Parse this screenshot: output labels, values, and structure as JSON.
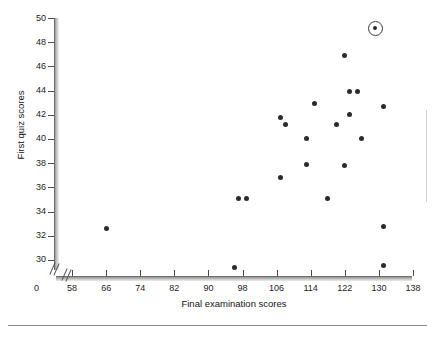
{
  "figure": {
    "title": "",
    "origin_label": "0"
  },
  "chart_data": {
    "type": "scatter",
    "title": "",
    "xlabel": "Final examination scores",
    "ylabel": "First quiz scores",
    "xlim": [
      54,
      138
    ],
    "ylim": [
      29,
      50
    ],
    "xticks": [
      58,
      66,
      74,
      82,
      90,
      98,
      106,
      114,
      122,
      130,
      138
    ],
    "yticks": [
      30,
      32,
      34,
      36,
      38,
      40,
      42,
      44,
      46,
      48,
      50
    ],
    "xtick_labels": [
      "58",
      "66",
      "74",
      "82",
      "90",
      "98",
      "106",
      "114",
      "122",
      "130",
      "138"
    ],
    "ytick_labels": [
      "30",
      "32",
      "34",
      "36",
      "38",
      "40",
      "42",
      "44",
      "46",
      "48",
      "50"
    ],
    "grid": false,
    "legend": false,
    "axis_break_x": true,
    "axis_break_y": true,
    "points": [
      {
        "x": 66,
        "y": 32.6,
        "highlighted": false
      },
      {
        "x": 96,
        "y": 29.4,
        "highlighted": false
      },
      {
        "x": 97,
        "y": 35.1,
        "highlighted": false
      },
      {
        "x": 99,
        "y": 35.1,
        "highlighted": false
      },
      {
        "x": 107,
        "y": 36.8,
        "highlighted": false
      },
      {
        "x": 107,
        "y": 41.8,
        "highlighted": false
      },
      {
        "x": 108,
        "y": 41.2,
        "highlighted": false
      },
      {
        "x": 113,
        "y": 37.9,
        "highlighted": false
      },
      {
        "x": 113,
        "y": 40.0,
        "highlighted": false
      },
      {
        "x": 115,
        "y": 42.9,
        "highlighted": false
      },
      {
        "x": 118,
        "y": 35.1,
        "highlighted": false
      },
      {
        "x": 120,
        "y": 41.2,
        "highlighted": false
      },
      {
        "x": 122,
        "y": 37.8,
        "highlighted": false
      },
      {
        "x": 122,
        "y": 46.9,
        "highlighted": false
      },
      {
        "x": 123,
        "y": 43.9,
        "highlighted": false
      },
      {
        "x": 123,
        "y": 42.0,
        "highlighted": false
      },
      {
        "x": 125,
        "y": 43.9,
        "highlighted": false
      },
      {
        "x": 126,
        "y": 40.0,
        "highlighted": false
      },
      {
        "x": 129,
        "y": 49.2,
        "highlighted": true
      },
      {
        "x": 131,
        "y": 42.7,
        "highlighted": false
      },
      {
        "x": 131,
        "y": 32.8,
        "highlighted": false
      },
      {
        "x": 131,
        "y": 29.5,
        "highlighted": false
      }
    ],
    "marker": {
      "shape": "circle",
      "color": "#2b2b2b",
      "size_px": 5,
      "highlight_ring_color": "#3a3a3a"
    }
  }
}
